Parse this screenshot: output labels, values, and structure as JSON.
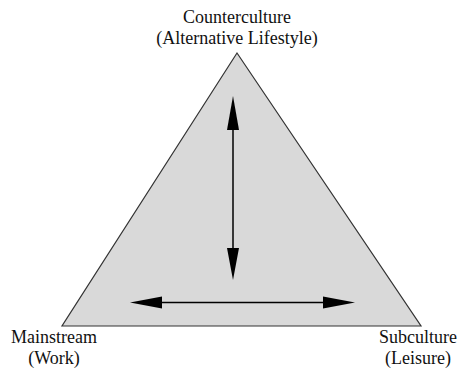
{
  "diagram": {
    "type": "triangle",
    "fill_color": "#d9d9d9",
    "stroke_color": "#333333",
    "vertices": {
      "top": {
        "title": "Counterculture",
        "subtitle": "(Alternative Lifestyle)"
      },
      "bottom_left": {
        "title": "Mainstream",
        "subtitle": "(Work)"
      },
      "bottom_right": {
        "title": "Subculture",
        "subtitle": "(Leisure)"
      }
    },
    "arrows": [
      {
        "orientation": "vertical",
        "direction": "bidirectional"
      },
      {
        "orientation": "horizontal",
        "direction": "bidirectional"
      }
    ]
  }
}
